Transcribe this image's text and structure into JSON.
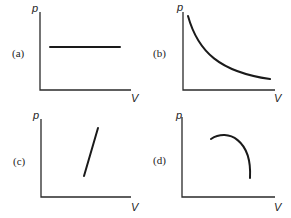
{
  "panels": [
    {
      "id": "a",
      "label": "(a)",
      "y_axis": "p",
      "x_axis": "V",
      "curve": "horizontal line (constant pressure)"
    },
    {
      "id": "b",
      "label": "(b)",
      "y_axis": "p",
      "x_axis": "V",
      "curve": "decreasing hyperbola (p inversely proportional to V)"
    },
    {
      "id": "c",
      "label": "(c)",
      "y_axis": "p",
      "x_axis": "V",
      "curve": "straight line with positive slope"
    },
    {
      "id": "d",
      "label": "(d)",
      "y_axis": "p",
      "x_axis": "V",
      "curve": "concave-down arc"
    }
  ],
  "colors": {
    "background": "#ffffff",
    "ink": "#1a1a1a"
  }
}
